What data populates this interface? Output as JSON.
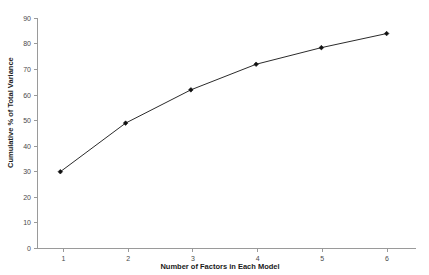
{
  "chart_data": {
    "type": "line",
    "title": "",
    "xlabel": "Number of Factors in Each Model",
    "ylabel": "Cumulative % of Total Variance",
    "x": [
      1,
      2,
      3,
      4,
      5,
      6
    ],
    "values": [
      30,
      49,
      62,
      72,
      78.5,
      84
    ],
    "xtick_labels": [
      "1",
      "2",
      "3",
      "4",
      "5",
      "6"
    ],
    "ytick_labels": [
      "0",
      "10",
      "20",
      "30",
      "40",
      "50",
      "60",
      "70",
      "80",
      "90"
    ],
    "ytick_values": [
      0,
      10,
      20,
      30,
      40,
      50,
      60,
      70,
      80,
      90
    ],
    "xlim": [
      0.65,
      6.45
    ],
    "ylim": [
      0,
      90
    ],
    "grid": false,
    "legend": false,
    "legend_position": "none",
    "series": [
      {
        "name": "Cumulative % of Total Variance",
        "values": [
          30,
          49,
          62,
          72,
          78.5,
          84
        ],
        "line_color": "#2b2b2b",
        "marker_color": "#111111",
        "marker": "diamond"
      }
    ],
    "colors": {
      "background": "#ffffff",
      "axis": "#9a9a9a",
      "tick_text": "#4a4a4a",
      "axis_title": "#1a1a1a",
      "line": "#2b2b2b",
      "marker": "#111111"
    }
  }
}
